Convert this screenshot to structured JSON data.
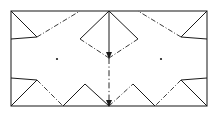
{
  "figure": {
    "canvas": {
      "width": 219,
      "height": 116
    },
    "colors": {
      "background": "#ffffff",
      "frame_stroke": "#2b2b2b",
      "solid_stroke": "#1a1a1a",
      "dashdot_stroke": "#3a3a3a",
      "dot_fill": "#1a1a1a"
    },
    "frame": {
      "label": "outer-rectangle",
      "x": 11,
      "y": 11,
      "width": 196,
      "height": 95,
      "line_style": "solid"
    },
    "center_axis": {
      "label": "vertical-center-line",
      "x": 109,
      "y_top": 11,
      "y_bottom": 106,
      "solid_segment_end": 58,
      "line_style_upper": "solid",
      "line_style_lower": "dash-dot"
    },
    "diamond": {
      "label": "center-diamond",
      "top_x": 109,
      "top_y": 11,
      "left_x": 80,
      "left_y": 39,
      "right_x": 138,
      "right_y": 39,
      "bottom_x": 109,
      "bottom_y": 58,
      "upper_edges_style": "solid",
      "lower_edges_style": "dash-dot"
    },
    "arrows": [
      {
        "label": "diamond-bottom-arrow",
        "x": 109,
        "y": 58,
        "direction": "down"
      },
      {
        "label": "axis-bottom-arrow",
        "x": 109,
        "y": 106,
        "direction": "down"
      }
    ],
    "dots": [
      {
        "label": "left-center-dot",
        "x": 57,
        "y": 59,
        "radius": 1.1
      },
      {
        "label": "right-center-dot",
        "x": 161,
        "y": 59,
        "radius": 1.1
      }
    ],
    "creases_solid": [
      {
        "label": "crease-tl-corner-down",
        "points": "11,11 37,37"
      },
      {
        "label": "crease-tr-corner-down",
        "points": "207,11 181,37"
      },
      {
        "label": "crease-bl-corner-up",
        "points": "11,106 37,80"
      },
      {
        "label": "crease-br-corner-up",
        "points": "207,106 181,80"
      },
      {
        "label": "crease-left-upper-in",
        "points": "11,39 37,37"
      },
      {
        "label": "crease-left-lower-in",
        "points": "11,78 37,80"
      },
      {
        "label": "crease-bottom-left-peak",
        "points": "63,106 85,84"
      },
      {
        "label": "crease-bottom-right-peak",
        "points": "155,106 133,84"
      },
      {
        "label": "crease-bottom-center-left",
        "points": "109,106 85,84"
      },
      {
        "label": "crease-right-upper-in",
        "points": "207,39 181,37"
      },
      {
        "label": "crease-right-lower-in",
        "points": "207,78 181,80"
      }
    ],
    "creases_dashdot": [
      {
        "label": "fold-tl-to-top-center",
        "points": "37,37 80,11"
      },
      {
        "label": "fold-tr-to-top-center",
        "points": "181,37 138,11"
      },
      {
        "label": "fold-bl-to-bottom",
        "points": "37,80 63,106"
      },
      {
        "label": "fold-br-to-bottom",
        "points": "181,80 155,106"
      },
      {
        "label": "fold-diamond-left-lower",
        "points": "80,39 109,58"
      },
      {
        "label": "fold-diamond-right-lower",
        "points": "138,39 109,58"
      },
      {
        "label": "fold-bottom-center-right",
        "points": "109,106 133,84"
      }
    ]
  }
}
